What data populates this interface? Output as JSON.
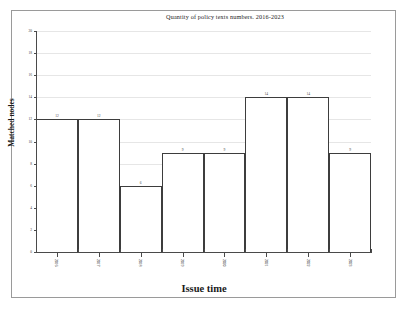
{
  "chart_data": {
    "type": "bar",
    "title": "Quantity of policy texts numbers.  2016-2023",
    "xlabel": "Issue time",
    "ylabel": "Matched nodes",
    "categories": [
      "2016",
      "2017",
      "2018",
      "2019",
      "2020",
      "2021",
      "2022",
      "2023"
    ],
    "values": [
      12,
      12,
      6,
      9,
      9,
      14,
      14,
      9
    ],
    "ylim": [
      0,
      20
    ],
    "ytick_values": [
      0,
      2,
      4,
      6,
      8,
      10,
      12,
      14,
      16,
      18,
      20
    ],
    "ytick_labels": [
      "0",
      "2",
      "4",
      "6",
      "8",
      "10",
      "12",
      "14",
      "16",
      "18",
      "20"
    ],
    "grid": true,
    "legend": false,
    "bar_edge_color": "#3d3d3d",
    "bar_fill_color": "#ffffff",
    "grid_color": "#e6e6e6",
    "axis_color": "#4a4a4a",
    "data_labels": [
      "12",
      "12",
      "6",
      "9",
      "9",
      "14",
      "14",
      "9"
    ]
  }
}
